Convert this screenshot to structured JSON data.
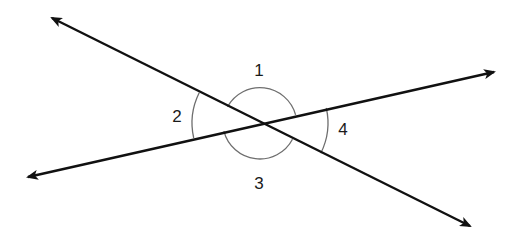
{
  "diagram": {
    "type": "intersecting-lines-angles",
    "colors": {
      "line": "#111111",
      "arc": "#6e6e6e",
      "label": "#1a1a1a",
      "background": "#ffffff"
    },
    "intersection": {
      "x": 260,
      "y": 123
    },
    "lines": [
      {
        "id": "line-a",
        "from": {
          "x": 52,
          "y": 18
        },
        "to": {
          "x": 470,
          "y": 226
        },
        "arrowheads": "both"
      },
      {
        "id": "line-b",
        "from": {
          "x": 28,
          "y": 177
        },
        "to": {
          "x": 494,
          "y": 72
        },
        "arrowheads": "both"
      }
    ],
    "angles": [
      {
        "label": "1",
        "position": "top"
      },
      {
        "label": "2",
        "position": "left"
      },
      {
        "label": "3",
        "position": "bottom"
      },
      {
        "label": "4",
        "position": "right"
      }
    ]
  }
}
